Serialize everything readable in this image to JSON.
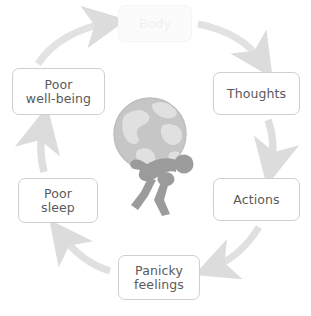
{
  "diagram": {
    "background_color": "#ffffff",
    "node_text_color": "#5a5a5a",
    "node_border_color": "#cfcfcf",
    "arrow_color": "#dcdcdc",
    "faded_node_color": "#f0f0f0",
    "globe_color": "#c2c2c2",
    "globe_land_color": "#dedede",
    "figure_color": "#9b9b9b",
    "direction": "clockwise",
    "nodes": [
      {
        "id": "body",
        "label": "Body",
        "position": "top",
        "state": "faded"
      },
      {
        "id": "thoughts",
        "label": "Thoughts",
        "position": "upper-right",
        "state": "normal"
      },
      {
        "id": "actions",
        "label": "Actions",
        "position": "lower-right",
        "state": "normal"
      },
      {
        "id": "panicky",
        "label": "Panicky\nfeelings",
        "position": "bottom",
        "state": "normal"
      },
      {
        "id": "sleep",
        "label": "Poor\nsleep",
        "position": "lower-left",
        "state": "normal"
      },
      {
        "id": "wellbeing",
        "label": "Poor\nwell-being",
        "position": "upper-left",
        "state": "normal"
      }
    ],
    "edges": [
      {
        "from": "body",
        "to": "thoughts",
        "shape": "curve-right-down"
      },
      {
        "from": "thoughts",
        "to": "actions",
        "shape": "curve-down"
      },
      {
        "from": "actions",
        "to": "panicky",
        "shape": "curve-down-left"
      },
      {
        "from": "panicky",
        "to": "sleep",
        "shape": "curve-up-left"
      },
      {
        "from": "sleep",
        "to": "wellbeing",
        "shape": "curve-up"
      },
      {
        "from": "wellbeing",
        "to": "body",
        "shape": "curve-up-right"
      }
    ],
    "center_illustration": {
      "name": "person-carrying-globe",
      "description": "Grey silhouette of a stooped person carrying a large globe on their back"
    }
  }
}
